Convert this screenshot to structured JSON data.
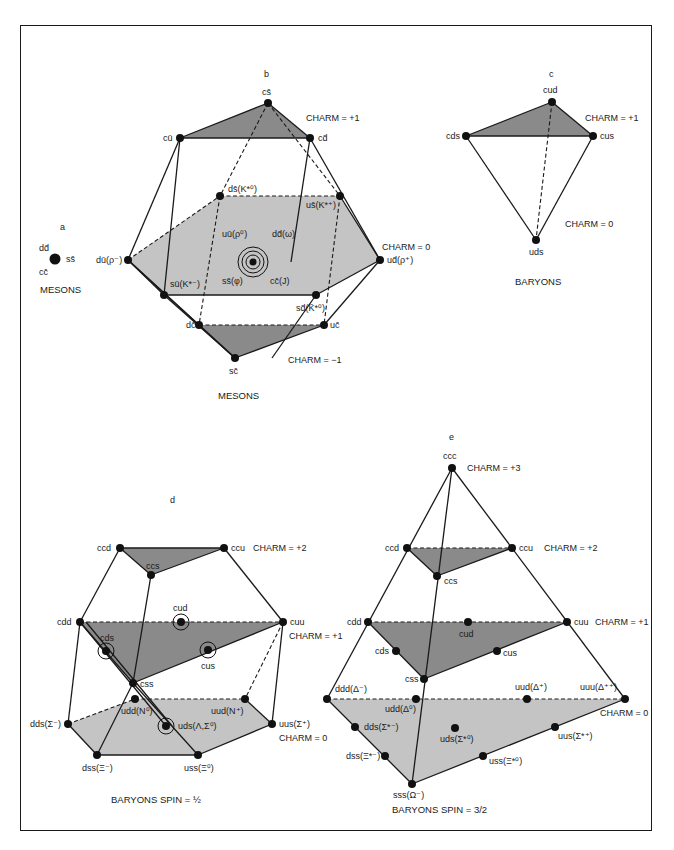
{
  "figure": {
    "panels": {
      "a": {
        "letter": "a",
        "caption": "MESONS",
        "labels": {
          "dd": "dd̄",
          "ss": "ss̄",
          "cc": "cc̄"
        }
      },
      "b": {
        "letter": "b",
        "caption": "MESONS",
        "charm_labels": {
          "plus1": "CHARM = +1",
          "zero": "CHARM = 0",
          "minus1": "CHARM = −1"
        },
        "nodes": {
          "cs": "cs̄",
          "cu": "cū",
          "cd": "cd̄",
          "du": "dū(ρ⁻)",
          "ud": "ud̄(ρ⁺)",
          "ds": "ds̄(K*⁰)",
          "us": "us̄(K*⁺)",
          "su": "sū(K*⁻)",
          "sd": "sd̄(K̄*⁰)",
          "uu": "uū(ρ⁰)",
          "dd": "dd̄(ω)",
          "ss": "ss̄(φ)",
          "cc": "cc̄(J)",
          "dc": "dc̄",
          "uc": "uc̄",
          "sc": "sc̄"
        }
      },
      "c": {
        "letter": "c",
        "caption": "BARYONS",
        "charm_labels": {
          "plus1": "CHARM = +1",
          "zero": "CHARM = 0"
        },
        "nodes": {
          "cud": "cud",
          "cds": "cds",
          "cus": "cus",
          "uds": "uds"
        }
      },
      "d": {
        "letter": "d",
        "caption": "BARYONS  SPIN = ½",
        "charm_labels": {
          "plus2": "CHARM = +2",
          "plus1": "CHARM = +1",
          "zero": "CHARM = 0"
        },
        "nodes": {
          "ccd": "ccd",
          "ccu": "ccu",
          "ccs": "ccs",
          "cdd": "cdd",
          "cuu": "cuu",
          "cud": "cud",
          "cds": "cds",
          "cus": "cus",
          "css": "css",
          "udd": "udd(N⁰)",
          "uud": "uud(N⁺)",
          "dds": "dds(Σ⁻)",
          "uus": "uus(Σ⁺)",
          "uds": "uds(Λ,Σ⁰)",
          "dss": "dss(Ξ⁻)",
          "uss": "uss(Ξ⁰)"
        }
      },
      "e": {
        "letter": "e",
        "caption": "BARYONS  SPIN = 3/2",
        "charm_labels": {
          "plus3": "CHARM = +3",
          "plus2": "CHARM = +2",
          "plus1": "CHARM = +1",
          "zero": "CHARM = 0"
        },
        "nodes": {
          "ccc": "ccc",
          "ccd": "ccd",
          "ccu": "ccu",
          "ccs": "ccs",
          "cdd": "cdd",
          "cuu": "cuu",
          "cud": "cud",
          "cds": "cds",
          "cus": "cus",
          "css": "css",
          "ddd": "ddd(Δ⁻)",
          "udd": "udd(Δ⁰)",
          "uud": "uud(Δ⁺)",
          "uuu": "uuu(Δ⁺⁺)",
          "dds": "dds(Σ*⁻)",
          "uus": "uus(Σ*⁺)",
          "uds": "uds(Σ*⁰)",
          "dss": "dss(Ξ*⁻)",
          "uss": "uss(Ξ*⁰)",
          "sss": "sss(Ω⁻)"
        }
      }
    },
    "colors": {
      "line": "#1a1a1a",
      "node": "#111111",
      "fill_dark": "#8a8a8a",
      "fill_light": "#c4c4c4",
      "background": "#ffffff"
    }
  }
}
